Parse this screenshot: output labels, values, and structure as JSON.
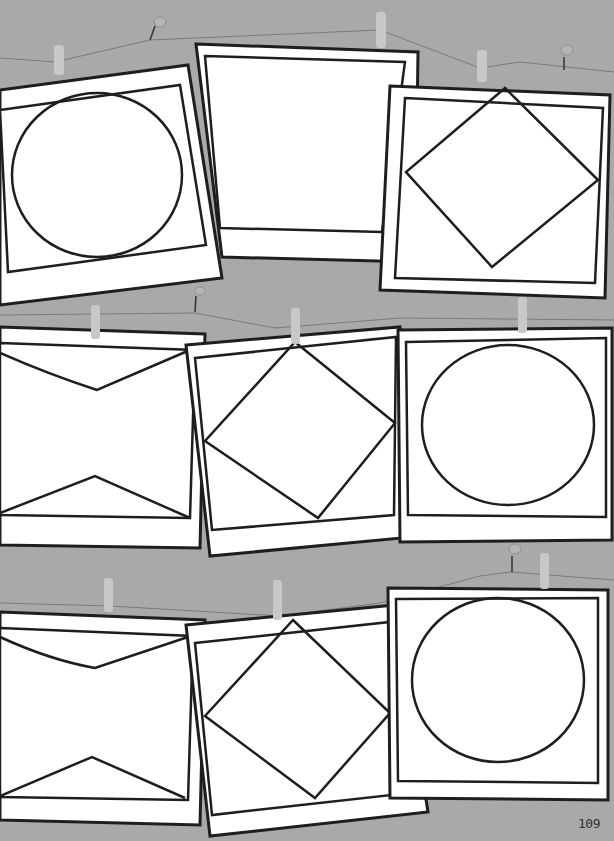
{
  "page": {
    "background_color": "#a9a9a9",
    "frame_fill": "#ffffff",
    "ink_color": "#1e1e1e",
    "string_color": "#7a7a7a",
    "clothespin_color": "#c8c8c8",
    "page_number": "109"
  },
  "rows": [
    {
      "frames": [
        {
          "shape": "circle"
        },
        {
          "shape": "blank"
        },
        {
          "shape": "diamond"
        }
      ]
    },
    {
      "frames": [
        {
          "shape": "bowtie"
        },
        {
          "shape": "diamond"
        },
        {
          "shape": "circle"
        }
      ]
    },
    {
      "frames": [
        {
          "shape": "bowtie"
        },
        {
          "shape": "diamond"
        },
        {
          "shape": "circle"
        }
      ]
    }
  ]
}
